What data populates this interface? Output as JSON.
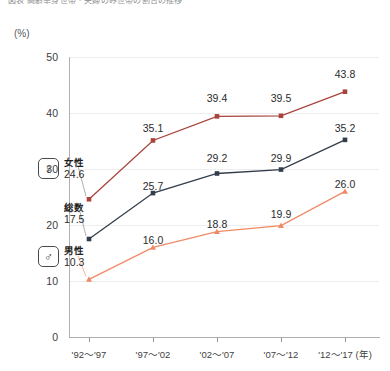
{
  "top_caption": "図表 高齢単身世帯・夫婦のみ世帯の割合の推移",
  "unit_label": "(%)",
  "chart_data": {
    "type": "line",
    "title": "",
    "xlabel": "(年)",
    "ylabel": "(%)",
    "ylim": [
      0,
      50
    ],
    "yticks": [
      0,
      10,
      20,
      30,
      40,
      50
    ],
    "grid": true,
    "legend_position": "inline-left",
    "categories": [
      "'92〜'97",
      "'97〜'02",
      "'02〜'07",
      "'07〜'12",
      "'12〜'17"
    ],
    "series": [
      {
        "name": "女性",
        "color": "#a8443c",
        "marker": "square",
        "values": [
          24.6,
          35.1,
          39.4,
          39.5,
          43.8
        ]
      },
      {
        "name": "総数",
        "color": "#333d4a",
        "marker": "square",
        "values": [
          17.5,
          25.7,
          29.2,
          29.9,
          35.2
        ]
      },
      {
        "name": "男性",
        "color": "#f08a66",
        "marker": "triangle",
        "values": [
          10.3,
          16.0,
          18.8,
          19.9,
          26.0
        ]
      }
    ]
  },
  "y_axis": {
    "ticks": [
      "50",
      "40",
      "30",
      "20",
      "10",
      "0"
    ]
  },
  "x_axis": {
    "labels": [
      "'92〜'97",
      "'97〜'02",
      "'02〜'07",
      "'07〜'12",
      "'12〜'17 (年)"
    ]
  },
  "legends": {
    "female": {
      "icon": "venus-symbol",
      "glyph": "♀",
      "name": "女性",
      "value": "24.6"
    },
    "total": {
      "icon": "none",
      "glyph": "",
      "name": "総数",
      "value": "17.5"
    },
    "male": {
      "icon": "mars-symbol",
      "glyph": "♂",
      "name": "男性",
      "value": "10.3"
    }
  },
  "value_labels": {
    "female": [
      "24.6",
      "35.1",
      "39.4",
      "39.5",
      "43.8"
    ],
    "total": [
      "17.5",
      "25.7",
      "29.2",
      "29.9",
      "35.2"
    ],
    "male": [
      "10.3",
      "16.0",
      "18.8",
      "19.9",
      "26.0"
    ]
  },
  "colors": {
    "female_line": "#a8443c",
    "total_line": "#333d4a",
    "male_line": "#f08a66",
    "axis": "#b0b0b0",
    "grid": "#eeeeee"
  }
}
